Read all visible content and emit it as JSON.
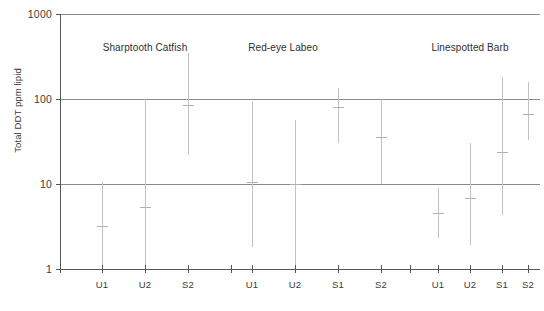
{
  "chart_data": {
    "type": "scatter",
    "title": "",
    "xlabel": "",
    "ylabel": "Total DDT ppm lipid",
    "yscale": "log",
    "ylim": [
      1,
      1000
    ],
    "ytick_labels": [
      "1000",
      "100",
      "10",
      "1"
    ],
    "ytick_values": [
      1000,
      100,
      10,
      1
    ],
    "grid": "horizontal gridlines at 1, 10, 100, 1000",
    "legend": "none",
    "categories": [
      "U1",
      "U2",
      "S2",
      "U1",
      "U2",
      "S1",
      "S2",
      "U1",
      "U2",
      "S1",
      "S2"
    ],
    "group_labels": [
      "Sharptooth Catfish",
      "Red-eye Labeo",
      "Linespotted Barb"
    ],
    "groups": [
      {
        "name": "Sharptooth Catfish",
        "points": [
          {
            "site": "U1",
            "mean": 3.2,
            "low": 1.0,
            "high": 10.5
          },
          {
            "site": "U2",
            "mean": 5.3,
            "low": 1.1,
            "high": 100.0
          },
          {
            "site": "S2",
            "mean": 85.0,
            "low": 22.0,
            "high": 350.0
          }
        ]
      },
      {
        "name": "Red-eye Labeo",
        "points": [
          {
            "site": "U1",
            "mean": 10.5,
            "low": 1.8,
            "high": 95.0
          },
          {
            "site": "U2",
            "mean": 10.0,
            "low": 1.05,
            "high": 57.0
          },
          {
            "site": "S1",
            "mean": 80.0,
            "low": 30.0,
            "high": 135.0
          },
          {
            "site": "S2",
            "mean": 36.0,
            "low": 10.0,
            "high": 100.0
          }
        ]
      },
      {
        "name": "Linespotted Barb",
        "points": [
          {
            "site": "U1",
            "mean": 4.6,
            "low": 2.3,
            "high": 9.0
          },
          {
            "site": "U2",
            "mean": 6.9,
            "low": 1.9,
            "high": 30.0
          },
          {
            "site": "S1",
            "mean": 24.0,
            "low": 4.3,
            "high": 180.0
          },
          {
            "site": "S2",
            "mean": 67.0,
            "low": 33.0,
            "high": 160.0
          }
        ]
      }
    ],
    "colors": {
      "axis": "#555555",
      "gridline": "#8a8a8a",
      "errorbar": "#c2c2c2",
      "text": "#3b3b3b"
    }
  },
  "axis": {
    "y_label": "Total DDT ppm lipid",
    "y_ticks": [
      {
        "label": "1000",
        "value": 1000
      },
      {
        "label": "100",
        "value": 100
      },
      {
        "label": "10",
        "value": 10
      },
      {
        "label": "1",
        "value": 1
      }
    ]
  },
  "x_axis": {
    "ticks": [
      {
        "label": "U1"
      },
      {
        "label": "U2"
      },
      {
        "label": "S2"
      },
      {
        "label": "U1"
      },
      {
        "label": "U2"
      },
      {
        "label": "S1"
      },
      {
        "label": "S2"
      },
      {
        "label": "U1"
      },
      {
        "label": "U2"
      },
      {
        "label": "S1"
      },
      {
        "label": "S2"
      }
    ]
  },
  "groups_header": [
    {
      "label": "Sharptooth Catfish"
    },
    {
      "label": "Red-eye Labeo"
    },
    {
      "label": "Linespotted Barb"
    }
  ]
}
